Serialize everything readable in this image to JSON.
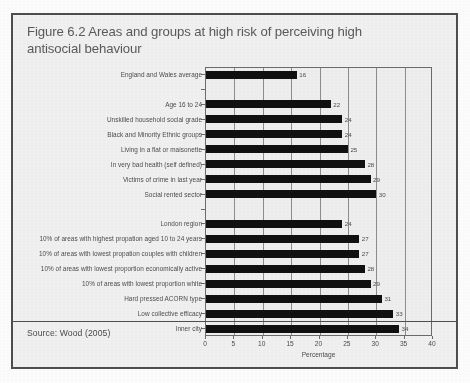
{
  "figure": {
    "title": "Figure 6.2 Areas and groups at high risk of perceiving high antisocial behaviour",
    "source": "Source: Wood (2005)"
  },
  "chart_data": {
    "type": "bar",
    "orientation": "horizontal",
    "title": "Figure 6.2 Areas and groups at high risk of perceiving high antisocial behaviour",
    "xlabel": "Percentage",
    "ylabel": "",
    "xlim": [
      0,
      40
    ],
    "xticks": [
      0,
      5,
      10,
      15,
      20,
      25,
      30,
      35,
      40
    ],
    "grid": "vertical",
    "legend": "none",
    "source": "Source: Wood (2005)",
    "categories": [
      "England and Wales average",
      "",
      "Age 16 to 24",
      "Unskilled household social grade",
      "Black and Minority Ethnic groups",
      "Living in a flat or maisonette",
      "In very bad health (self defined)",
      "Victims of crime in last year",
      "Social rented sector",
      "",
      "London region",
      "10% of areas with highest propation aged 10 to 24 years",
      "10% of areas with lowest propation couples with children",
      "10% of areas with lowest proportion economically active",
      "10% of areas with lowest proportion white",
      "Hard pressed ACORN type",
      "Low collective efficacy",
      "Inner city"
    ],
    "values": [
      16,
      null,
      22,
      24,
      24,
      25,
      28,
      29,
      30,
      null,
      24,
      27,
      27,
      28,
      29,
      31,
      33,
      34
    ],
    "value_labels": [
      "16",
      "",
      "22",
      "24",
      "24",
      "25",
      "28",
      "29",
      "30",
      "",
      "24",
      "27",
      "27",
      "28",
      "29",
      "31",
      "33",
      "34"
    ]
  }
}
